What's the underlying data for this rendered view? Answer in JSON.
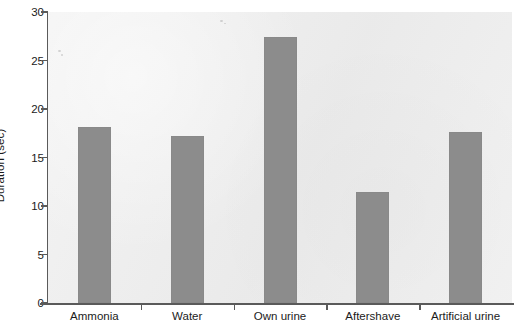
{
  "chart_data": {
    "type": "bar",
    "title": "",
    "xlabel": "",
    "ylabel": "Duration (sec)",
    "categories": [
      "Ammonia",
      "Water",
      "Own urine",
      "Aftershave",
      "Artificial urine"
    ],
    "values": [
      18.1,
      17.2,
      27.4,
      11.4,
      17.6
    ],
    "ylim": [
      0,
      30
    ],
    "yticks": [
      0,
      5,
      10,
      15,
      20,
      25,
      30
    ],
    "ytick_labels": [
      "0",
      "5",
      "10",
      "15",
      "20",
      "25",
      "30"
    ],
    "grid": false,
    "legend": null,
    "series": [
      {
        "name": "Duration",
        "values": [
          18.1,
          17.2,
          27.4,
          11.4,
          17.6
        ]
      }
    ],
    "colors": {
      "bar": "#8c8c8c",
      "plot_background": "#ededed",
      "figure_background": "#ffffff",
      "axis": "#5a5a5a",
      "text": "#1b1b1b"
    }
  }
}
